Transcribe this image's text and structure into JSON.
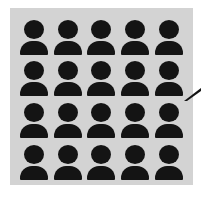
{
  "figure": {
    "rows": 4,
    "columns": 5,
    "total_icons": 20,
    "icon": "person-icon",
    "colors": {
      "background": "#ffffff",
      "panel": "#d3d3d3",
      "icon": "#141414",
      "pointer": "#141414"
    },
    "pointer": "callout-pointer-icon"
  }
}
